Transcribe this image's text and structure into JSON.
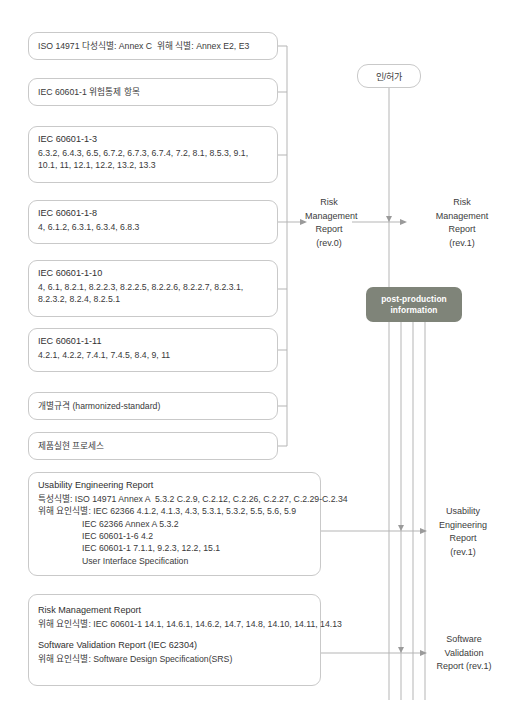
{
  "diagram": {
    "left_boxes": [
      {
        "id": "iso14971",
        "lines": [
          "ISO 14971 다성식별: Annex C  위해 식별: Annex E2, E3"
        ]
      },
      {
        "id": "iec60601-1",
        "lines": [
          "IEC 60601-1 위험통제 항목"
        ]
      },
      {
        "id": "iec60601-1-3",
        "title": "IEC 60601-1-3",
        "lines": [
          "6.3.2, 6.4.3, 6.5, 6.7.2, 6.7.3, 6.7.4, 7.2, 8.1, 8.5.3, 9.1,",
          "10.1, 11, 12.1, 12.2, 13.2, 13.3"
        ]
      },
      {
        "id": "iec60601-1-8",
        "title": "IEC 60601-1-8",
        "lines": [
          "4, 6.1.2, 6.3.1, 6.3.4, 6.8.3"
        ]
      },
      {
        "id": "iec60601-1-10",
        "title": "IEC 60601-1-10",
        "lines": [
          "4, 6.1, 8.2.1, 8.2.2.3, 8.2.2.5, 8.2.2.6, 8.2.2.7, 8.2.3.1,",
          "8.2.3.2, 8.2.4, 8.2.5.1"
        ]
      },
      {
        "id": "iec60601-1-11",
        "title": "IEC 60601-1-11",
        "lines": [
          "4.2.1, 4.2.2, 7.4.1, 7.4.5, 8.4, 9, 11"
        ]
      },
      {
        "id": "harmonized",
        "lines": [
          "개별규격 (harmonized-standard)"
        ]
      },
      {
        "id": "product-realization",
        "lines": [
          "제품실현 프로세스"
        ]
      }
    ],
    "usability_box": {
      "id": "usability-engineering-report",
      "title": "Usability Engineering Report",
      "lines": [
        "특성식별: ISO 14971 Annex A  5.3.2 C.2.9, C.2.12, C.2.26, C.2.27, C.2.29-C.2.34",
        "위해 요인식별: IEC 62366 4.1.2, 4.1.3, 4.3, 5.3.1, 5.3.2, 5.5, 5.6, 5.9"
      ],
      "indented_lines": [
        "IEC 62366 Annex A 5.3.2",
        "IEC 60601-1-6 4.2",
        "IEC 60601-1 7.1.1, 9.2.3, 12.2, 15.1",
        "User Interface Specification"
      ]
    },
    "bottom_box": {
      "id": "risk-and-software-validation",
      "risk_title": "Risk Management Report",
      "risk_line": "위해 요인식별: IEC 60601-1 14.1, 14.6.1, 14.6.2, 14.7, 14.8, 14.10, 14.11, 14.13",
      "software_title": "Software Validation Report (IEC 62304)",
      "software_line": "위해 요인식별: Software Design Specification(SRS)"
    },
    "badges": {
      "approval": "인/허가",
      "post_production_line1": "post-production",
      "post_production_line2": "information",
      "post_production_color": "#7f8479"
    },
    "outputs": {
      "risk_rev0": [
        "Risk",
        "Management",
        "Report",
        "(rev.0)"
      ],
      "risk_rev1": [
        "Risk",
        "Management",
        "Report",
        "(rev.1)"
      ],
      "usability_rev1": [
        "Usability",
        "Engineering",
        "Report",
        "(rev.1)"
      ],
      "software_rev1": [
        "Software",
        "Validation",
        "Report (rev.1)"
      ]
    }
  }
}
